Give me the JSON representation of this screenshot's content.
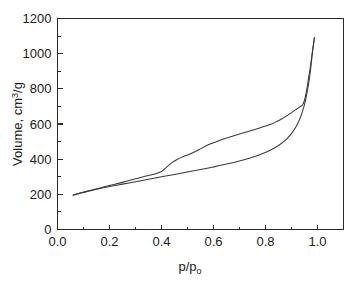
{
  "chart_data": {
    "type": "line",
    "title": "",
    "subtitle": "",
    "xlabel": "p/p",
    "xlabel_sub": "o",
    "ylabel": "Volume, cm",
    "ylabel_sup": "3",
    "ylabel_tail": "/g",
    "xlim": [
      0.0,
      1.1
    ],
    "ylim": [
      0,
      1200
    ],
    "xticks": [
      0.0,
      0.2,
      0.4,
      0.6,
      0.8,
      1.0
    ],
    "xticklabels": [
      "0.0",
      "0.2",
      "0.4",
      "0.6",
      "0.8",
      "1.0"
    ],
    "yticks": [
      0,
      200,
      400,
      600,
      800,
      1000,
      1200
    ],
    "yticklabels": [
      "0",
      "200",
      "400",
      "600",
      "800",
      "1000",
      "1200"
    ],
    "xminor_step": 0.1,
    "yminor_step": 100,
    "grid": false,
    "legend": null,
    "annotations": [],
    "series": [
      {
        "name": "adsorption",
        "color": "#3a3a3a",
        "x": [
          0.06,
          0.09,
          0.12,
          0.16,
          0.2,
          0.25,
          0.3,
          0.35,
          0.4,
          0.45,
          0.5,
          0.55,
          0.6,
          0.65,
          0.7,
          0.75,
          0.79,
          0.82,
          0.85,
          0.88,
          0.9,
          0.92,
          0.935,
          0.95,
          0.96,
          0.968,
          0.975,
          0.98,
          0.985,
          0.988
        ],
        "y": [
          195,
          207,
          218,
          232,
          244,
          258,
          272,
          286,
          300,
          313,
          327,
          341,
          356,
          372,
          390,
          411,
          432,
          452,
          478,
          513,
          545,
          592,
          640,
          710,
          780,
          850,
          930,
          1000,
          1060,
          1090
        ]
      },
      {
        "name": "desorption",
        "color": "#3a3a3a",
        "x": [
          0.988,
          0.984,
          0.978,
          0.972,
          0.965,
          0.958,
          0.95,
          0.943,
          0.935,
          0.925,
          0.915,
          0.9,
          0.88,
          0.86,
          0.84,
          0.82,
          0.78,
          0.74,
          0.7,
          0.66,
          0.62,
          0.58,
          0.545,
          0.52,
          0.5,
          0.48,
          0.46,
          0.44,
          0.42,
          0.4,
          0.37,
          0.34,
          0.3,
          0.25,
          0.2,
          0.16,
          0.12,
          0.09,
          0.06
        ],
        "y": [
          1090,
          1045,
          985,
          920,
          855,
          790,
          735,
          710,
          700,
          690,
          680,
          665,
          645,
          627,
          612,
          598,
          578,
          560,
          543,
          525,
          505,
          482,
          455,
          437,
          424,
          412,
          398,
          380,
          355,
          330,
          314,
          304,
          288,
          268,
          250,
          235,
          220,
          209,
          196
        ]
      }
    ]
  }
}
